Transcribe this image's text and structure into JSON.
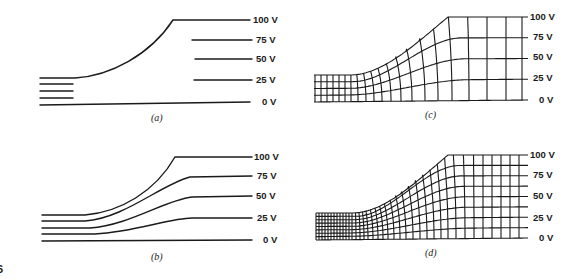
{
  "figure": {
    "fig_number_fragment": "6",
    "voltage_labels": [
      "100 V",
      "75 V",
      "50 V",
      "25 V",
      "0 V"
    ],
    "panels": [
      {
        "id": "a",
        "caption": "(a)",
        "description": "Equipotential lines with only the boundary conductors; interior lines incomplete"
      },
      {
        "id": "b",
        "caption": "(b)",
        "description": "Sketched equipotential lines between conductors"
      },
      {
        "id": "c",
        "caption": "(c)",
        "description": "Curvilinear squares — coarse field map"
      },
      {
        "id": "d",
        "caption": "(d)",
        "description": "Curvilinear squares — refined field map"
      }
    ]
  },
  "colors": {
    "ink": "#1a1a1a",
    "background": "#ffffff"
  }
}
